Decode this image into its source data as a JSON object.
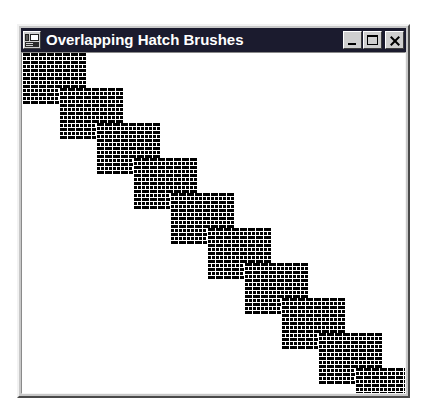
{
  "window": {
    "title": "Overlapping Hatch Brushes",
    "sysmenu_icon": "application-window-icon",
    "controls": {
      "minimize_label": "Minimize",
      "maximize_label": "Maximize",
      "close_label": "Close"
    },
    "colors": {
      "titlebar_background": "#1b1b2e",
      "titlebar_text": "#ffffff",
      "frame_face": "#c8c8c8",
      "client_background": "#ffffff",
      "hatch_foreground": "#000000",
      "hatch_background": "#ffffff"
    }
  },
  "canvas": {
    "description": "Diagonal staircase of overlapping rectangles filled with a horizontal brick hatch brush",
    "block_count": 10,
    "block_width": 64,
    "block_height": 52,
    "step_x": 37,
    "step_y": 35,
    "hatch_style": "brick-horizontal",
    "blocks": [
      {
        "index": 1,
        "x": 0,
        "y": 0
      },
      {
        "index": 2,
        "x": 37,
        "y": 35
      },
      {
        "index": 3,
        "x": 74,
        "y": 70
      },
      {
        "index": 4,
        "x": 111,
        "y": 105
      },
      {
        "index": 5,
        "x": 148,
        "y": 140
      },
      {
        "index": 6,
        "x": 185,
        "y": 175
      },
      {
        "index": 7,
        "x": 222,
        "y": 210
      },
      {
        "index": 8,
        "x": 259,
        "y": 245
      },
      {
        "index": 9,
        "x": 296,
        "y": 280
      },
      {
        "index": 10,
        "x": 333,
        "y": 315
      }
    ]
  }
}
